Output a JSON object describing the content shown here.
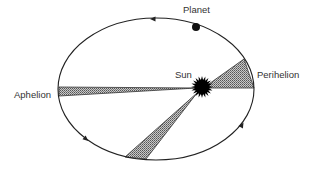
{
  "diagram": {
    "type": "orbit-diagram",
    "labels": {
      "planet": "Planet",
      "sun": "Sun",
      "perihelion": "Perihelion",
      "aphelion": "Aphelion"
    },
    "colors": {
      "orbit_stroke": "#222222",
      "wedge_fill": "#9a9a9a",
      "sun_fill": "#000000",
      "planet_fill": "#111111",
      "text": "#333333"
    },
    "orbit": {
      "cx": 156,
      "cy": 89,
      "rx": 98,
      "ry": 71
    },
    "sun": {
      "x": 202,
      "y": 87,
      "r": 8,
      "rays": 20
    },
    "planet": {
      "x": 196,
      "y": 27,
      "r": 4
    },
    "direction_arrows": [
      {
        "x": 153,
        "y": 19,
        "direction": "left"
      },
      {
        "x": 86,
        "y": 139,
        "direction": "down-right"
      },
      {
        "x": 242,
        "y": 125,
        "direction": "up-right"
      }
    ],
    "swept_areas": [
      {
        "name": "aphelion-wedge",
        "points": [
          [
            59,
            87
          ],
          [
            196,
            88
          ],
          [
            59,
            96
          ]
        ]
      },
      {
        "name": "perihelion-wedge",
        "points": [
          [
            206,
            86
          ],
          [
            244,
            59
          ],
          [
            254,
            88
          ],
          [
            206,
            88
          ]
        ]
      },
      {
        "name": "lower-wedge",
        "points": [
          [
            197,
            93
          ],
          [
            146,
            159
          ],
          [
            125,
            157
          ]
        ]
      }
    ]
  }
}
